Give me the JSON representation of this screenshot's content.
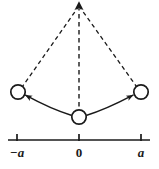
{
  "figure": {
    "type": "physics-diagram",
    "background_color": "#ffffff",
    "stroke_color": "#1a1a1a",
    "pivot": {
      "x": 79,
      "y": 2
    },
    "bobs": [
      {
        "name": "left-bob",
        "label": "-a",
        "cx": 18,
        "cy": 92,
        "r": 7.5
      },
      {
        "name": "center-bob",
        "label": "0",
        "cx": 79,
        "cy": 117,
        "r": 7.5
      },
      {
        "name": "right-bob",
        "label": "a",
        "cx": 141,
        "cy": 92,
        "r": 7.5
      }
    ],
    "dashed_lines": [
      {
        "name": "left-string",
        "x1": 79,
        "y1": 5,
        "x2": 22,
        "y2": 86
      },
      {
        "name": "center-string",
        "x1": 79,
        "y1": 5,
        "x2": 79,
        "y2": 109
      },
      {
        "name": "right-string",
        "x1": 79,
        "y1": 5,
        "x2": 137,
        "y2": 86
      }
    ],
    "arcs": [
      {
        "name": "left-swing-arrow",
        "from": "center-bob",
        "to": "left-bob",
        "direction": "leftward"
      },
      {
        "name": "right-swing-arrow",
        "from": "center-bob",
        "to": "right-bob",
        "direction": "rightward"
      }
    ],
    "pivot_arrow": {
      "name": "pivot-up-arrow",
      "direction": "up"
    }
  },
  "axis": {
    "name": "displacement-axis",
    "x_start": 8,
    "x_end": 150,
    "y": 140,
    "ticks": [
      {
        "name": "tick-minus-a",
        "x": 17,
        "label": "−a",
        "italic": true
      },
      {
        "name": "tick-zero",
        "x": 79,
        "label": "0",
        "italic": false
      },
      {
        "name": "tick-a",
        "x": 141,
        "label": "a",
        "italic": true
      }
    ],
    "label_y": 146
  }
}
